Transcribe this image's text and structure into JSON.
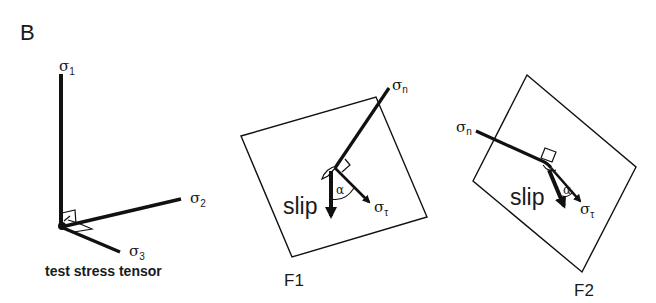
{
  "figure": {
    "panel_label": "B",
    "background": "#ffffff",
    "ink_color": "#111111"
  },
  "panels": [
    {
      "id": "test-stress-tensor",
      "caption": "test stress tensor",
      "axes": [
        {
          "name": "sigma1",
          "symbol": "σ",
          "subscript": "1"
        },
        {
          "name": "sigma2",
          "symbol": "σ",
          "subscript": "2"
        },
        {
          "name": "sigma3",
          "symbol": "σ",
          "subscript": "3"
        }
      ]
    },
    {
      "id": "F1",
      "label": "F1",
      "normal": {
        "symbol": "σ",
        "subscript": "n"
      },
      "shear": {
        "symbol": "σ",
        "subscript": "τ"
      },
      "slip_label": "slip",
      "angle_label": "α"
    },
    {
      "id": "F2",
      "label": "F2",
      "normal": {
        "symbol": "σ",
        "subscript": "n"
      },
      "shear": {
        "symbol": "σ",
        "subscript": "τ"
      },
      "slip_label": "slip",
      "angle_label": "α"
    }
  ]
}
